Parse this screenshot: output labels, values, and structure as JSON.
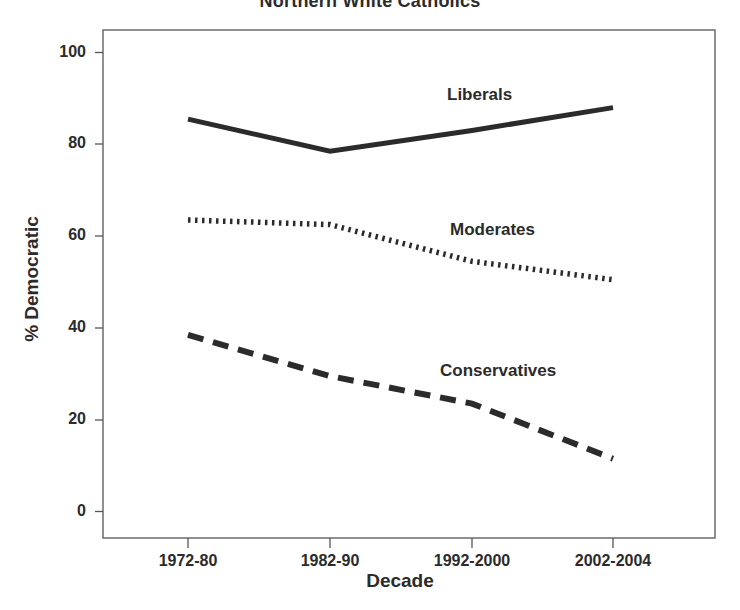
{
  "chart_data": {
    "type": "line",
    "title": "Northern White Catholics",
    "xlabel": "Decade",
    "ylabel": "% Democratic",
    "categories": [
      "1972-80",
      "1982-90",
      "1992-2000",
      "2002-2004"
    ],
    "ylim": [
      0,
      105
    ],
    "yticks": [
      0,
      20,
      40,
      60,
      80,
      100
    ],
    "ytick_labels": [
      "0",
      "20",
      "40",
      "60",
      "80",
      "100"
    ],
    "grid": false,
    "legend_position": "inline-labels",
    "series": [
      {
        "name": "Liberals",
        "style": "solid",
        "color": "#2b2b2b",
        "values": [
          85.5,
          78.5,
          83.0,
          88.0
        ]
      },
      {
        "name": "Moderates",
        "style": "dotted",
        "color": "#2b2b2b",
        "values": [
          63.5,
          62.5,
          54.5,
          50.5
        ]
      },
      {
        "name": "Conservatives",
        "style": "dashed",
        "color": "#2b2b2b",
        "values": [
          38.5,
          29.5,
          23.5,
          11.5
        ]
      }
    ],
    "annotations": [
      {
        "text": "Liberals",
        "x": 490,
        "y": 97
      },
      {
        "text": "Moderates",
        "x": 500,
        "y": 232
      },
      {
        "text": "Conservatives",
        "x": 510,
        "y": 373
      }
    ]
  }
}
